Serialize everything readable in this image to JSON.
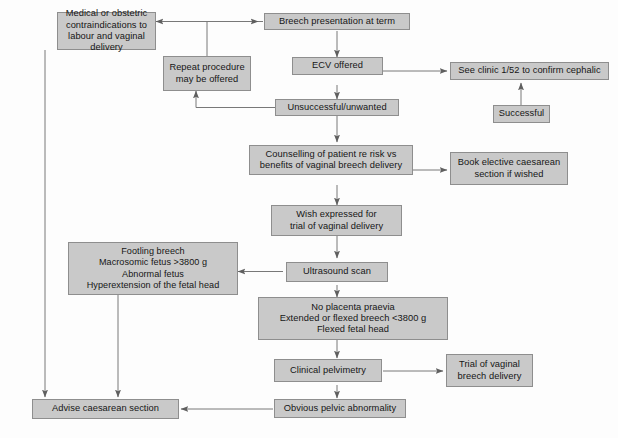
{
  "figure": {
    "kind": "flowchart",
    "caption_partial": ""
  },
  "style": {
    "node_fill": "#c9c9c9",
    "node_border": "#8e8e8e",
    "edge_color": "#6d6d6d",
    "text_color": "#161616",
    "background": "#fdfdfd"
  },
  "nodes": {
    "contraindications": "Medical or obstetric\ncontraindications to\nlabour and vaginal delivery",
    "breech_presentation": "Breech presentation at term",
    "repeat_procedure": "Repeat procedure\nmay be offered",
    "ecv_offered": "ECV offered",
    "see_clinic": "See clinic 1/52 to confirm cephalic",
    "successful": "Successful",
    "unsuccessful": "Unsuccessful/unwanted",
    "counselling": "Counselling of patient re risk vs\nbenefits of vaginal breech delivery",
    "book_elective": "Book elective caesarean\nsection if wished",
    "wish_expressed": "Wish expressed for\ntrial of vaginal delivery",
    "footling": "Footling breech\nMacrosomic fetus >3800 g\nAbnormal fetus\nHyperextension of the fetal head",
    "ultrasound": "Ultrasound scan",
    "no_placenta": "No placenta praevia\nExtended or flexed breech <3800 g\nFlexed fetal head",
    "pelvimetry": "Clinical pelvimetry",
    "trial_vaginal": "Trial of vaginal\nbreech delivery",
    "obvious_pelvic": "Obvious pelvic abnormality",
    "advise_caesarean": "Advise caesarean section"
  },
  "edges": [
    {
      "from": "breech_presentation",
      "to": "contraindications",
      "label": ""
    },
    {
      "from": "breech_presentation",
      "to": "ecv_offered",
      "label": ""
    },
    {
      "from": "ecv_offered",
      "to": "see_clinic",
      "label": ""
    },
    {
      "from": "successful",
      "to": "see_clinic",
      "label": ""
    },
    {
      "from": "ecv_offered",
      "to": "unsuccessful",
      "label": ""
    },
    {
      "from": "unsuccessful",
      "to": "repeat_procedure",
      "label": ""
    },
    {
      "from": "repeat_procedure",
      "to": "breech_presentation",
      "label": ""
    },
    {
      "from": "unsuccessful",
      "to": "counselling",
      "label": ""
    },
    {
      "from": "counselling",
      "to": "book_elective",
      "label": ""
    },
    {
      "from": "counselling",
      "to": "wish_expressed",
      "label": ""
    },
    {
      "from": "wish_expressed",
      "to": "ultrasound",
      "label": ""
    },
    {
      "from": "ultrasound",
      "to": "footling",
      "label": ""
    },
    {
      "from": "ultrasound",
      "to": "no_placenta",
      "label": ""
    },
    {
      "from": "no_placenta",
      "to": "pelvimetry",
      "label": ""
    },
    {
      "from": "pelvimetry",
      "to": "trial_vaginal",
      "label": ""
    },
    {
      "from": "pelvimetry",
      "to": "obvious_pelvic",
      "label": ""
    },
    {
      "from": "obvious_pelvic",
      "to": "advise_caesarean",
      "label": ""
    },
    {
      "from": "footling",
      "to": "advise_caesarean",
      "label": ""
    },
    {
      "from": "contraindications",
      "to": "advise_caesarean",
      "label": ""
    }
  ]
}
